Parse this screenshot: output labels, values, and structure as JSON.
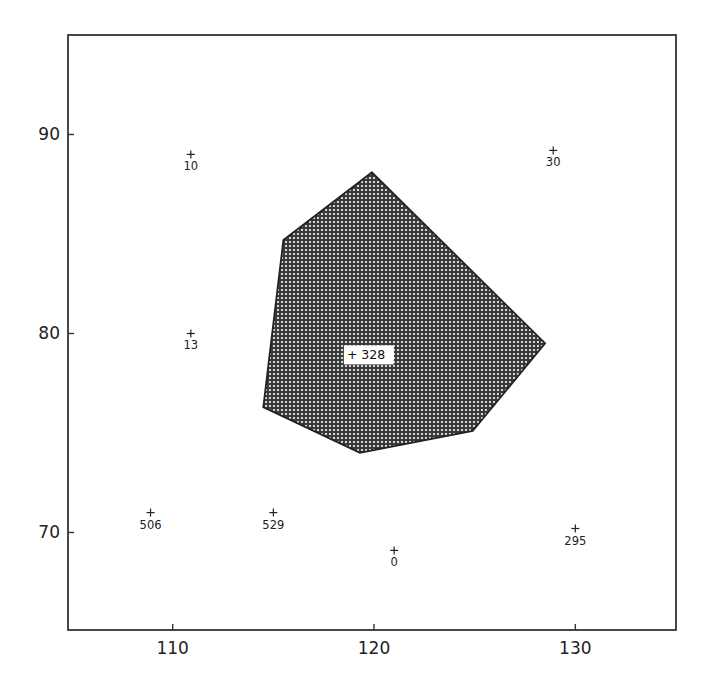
{
  "chart_data": {
    "type": "scatter",
    "title": "",
    "xlabel": "",
    "ylabel": "",
    "xlim": [
      104.8,
      135.0
    ],
    "ylim": [
      65.1,
      95.0
    ],
    "grid": false,
    "legend": null,
    "x_ticks": [
      110,
      120,
      130
    ],
    "y_ticks": [
      70,
      80,
      90
    ],
    "x_tick_labels": [
      "110",
      "120",
      "130"
    ],
    "y_tick_labels": [
      "70",
      "80",
      "90"
    ],
    "points": [
      {
        "label": "10",
        "x": 110.9,
        "y": 89.0
      },
      {
        "label": "30",
        "x": 128.9,
        "y": 89.2
      },
      {
        "label": "13",
        "x": 110.9,
        "y": 80.0
      },
      {
        "label": "506",
        "x": 108.9,
        "y": 71.0
      },
      {
        "label": "529",
        "x": 115.0,
        "y": 71.0
      },
      {
        "label": "0",
        "x": 121.0,
        "y": 69.1
      },
      {
        "label": "295",
        "x": 130.0,
        "y": 70.2
      }
    ],
    "highlight_point": {
      "label": "328",
      "x": 119.0,
      "y": 78.9
    },
    "polygon": {
      "fill": "cross-hatched",
      "vertices": [
        {
          "x": 119.9,
          "y": 88.1
        },
        {
          "x": 128.5,
          "y": 79.5
        },
        {
          "x": 124.9,
          "y": 75.1
        },
        {
          "x": 119.3,
          "y": 74.0
        },
        {
          "x": 114.5,
          "y": 76.3
        },
        {
          "x": 115.5,
          "y": 84.7
        }
      ]
    }
  },
  "colors": {
    "background": "#ffffff",
    "ink": "#222222",
    "hatch": "#2a2a2a"
  },
  "labels": {
    "center_label": "+ 328"
  }
}
